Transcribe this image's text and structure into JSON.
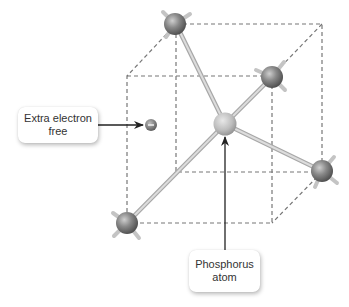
{
  "diagram": {
    "type": "n-type silicon doping illustration",
    "labels": {
      "electron": {
        "line1": "Extra electron",
        "line2": "free"
      },
      "phosphorus": {
        "line1": "Phosphorus",
        "line2": "atom"
      }
    },
    "colors": {
      "cube_edge": "#777777",
      "bond": "#c8c8c8",
      "silicon_atom": "#7a7a7a",
      "phosphorus_atom": "#c2c2c2",
      "electron": "#777777",
      "arrow": "#222222",
      "label_text": "#333333"
    },
    "atoms": [
      {
        "name": "silicon",
        "position": "back-top-left"
      },
      {
        "name": "silicon",
        "position": "front-top-right"
      },
      {
        "name": "silicon",
        "position": "back-bottom-right"
      },
      {
        "name": "silicon",
        "position": "front-bottom-left"
      },
      {
        "name": "phosphorus",
        "position": "center"
      }
    ],
    "electron_symbol": "−"
  }
}
